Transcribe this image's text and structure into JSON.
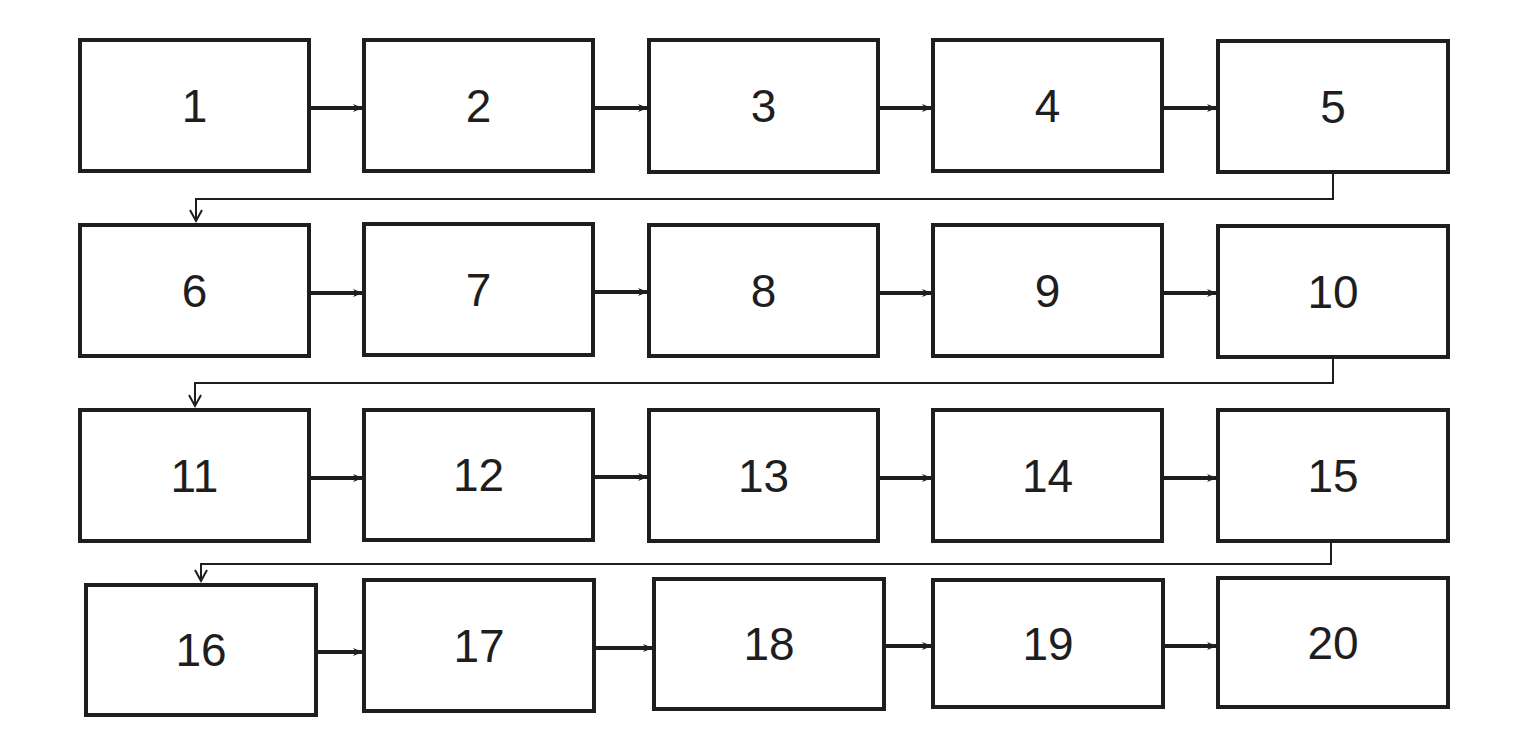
{
  "diagram": {
    "type": "sequential-flowchart",
    "colors": {
      "stroke": "#1e1e1e",
      "background": "#ffffff"
    },
    "steps": [
      {
        "id": 1,
        "label": "1",
        "x": 78,
        "y": 38,
        "w": 233,
        "h": 135
      },
      {
        "id": 2,
        "label": "2",
        "x": 362,
        "y": 38,
        "w": 233,
        "h": 135
      },
      {
        "id": 3,
        "label": "3",
        "x": 647,
        "y": 38,
        "w": 233,
        "h": 136
      },
      {
        "id": 4,
        "label": "4",
        "x": 931,
        "y": 38,
        "w": 233,
        "h": 135
      },
      {
        "id": 5,
        "label": "5",
        "x": 1216,
        "y": 39,
        "w": 234,
        "h": 135
      },
      {
        "id": 6,
        "label": "6",
        "x": 78,
        "y": 223,
        "w": 233,
        "h": 135
      },
      {
        "id": 7,
        "label": "7",
        "x": 362,
        "y": 222,
        "w": 233,
        "h": 135
      },
      {
        "id": 8,
        "label": "8",
        "x": 647,
        "y": 223,
        "w": 233,
        "h": 135
      },
      {
        "id": 9,
        "label": "9",
        "x": 931,
        "y": 223,
        "w": 233,
        "h": 135
      },
      {
        "id": 10,
        "label": "10",
        "x": 1216,
        "y": 224,
        "w": 234,
        "h": 135
      },
      {
        "id": 11,
        "label": "11",
        "x": 78,
        "y": 408,
        "w": 233,
        "h": 135
      },
      {
        "id": 12,
        "label": "12",
        "x": 362,
        "y": 408,
        "w": 233,
        "h": 134
      },
      {
        "id": 13,
        "label": "13",
        "x": 647,
        "y": 408,
        "w": 233,
        "h": 135
      },
      {
        "id": 14,
        "label": "14",
        "x": 931,
        "y": 408,
        "w": 233,
        "h": 135
      },
      {
        "id": 15,
        "label": "15",
        "x": 1216,
        "y": 408,
        "w": 234,
        "h": 135
      },
      {
        "id": 16,
        "label": "16",
        "x": 84,
        "y": 583,
        "w": 234,
        "h": 134
      },
      {
        "id": 17,
        "label": "17",
        "x": 362,
        "y": 578,
        "w": 234,
        "h": 135
      },
      {
        "id": 18,
        "label": "18",
        "x": 652,
        "y": 577,
        "w": 234,
        "h": 134
      },
      {
        "id": 19,
        "label": "19",
        "x": 931,
        "y": 578,
        "w": 234,
        "h": 131
      },
      {
        "id": 20,
        "label": "20",
        "x": 1216,
        "y": 576,
        "w": 234,
        "h": 133
      }
    ],
    "connections": [
      {
        "from": 1,
        "to": 2
      },
      {
        "from": 2,
        "to": 3
      },
      {
        "from": 3,
        "to": 4
      },
      {
        "from": 4,
        "to": 5
      },
      {
        "from": 5,
        "to": 6,
        "kind": "wrap"
      },
      {
        "from": 6,
        "to": 7
      },
      {
        "from": 7,
        "to": 8
      },
      {
        "from": 8,
        "to": 9
      },
      {
        "from": 9,
        "to": 10
      },
      {
        "from": 10,
        "to": 11,
        "kind": "wrap"
      },
      {
        "from": 11,
        "to": 12
      },
      {
        "from": 12,
        "to": 13
      },
      {
        "from": 13,
        "to": 14
      },
      {
        "from": 14,
        "to": 15
      },
      {
        "from": 15,
        "to": 16,
        "kind": "wrap"
      },
      {
        "from": 16,
        "to": 17
      },
      {
        "from": 17,
        "to": 18
      },
      {
        "from": 18,
        "to": 19
      },
      {
        "from": 19,
        "to": 20
      }
    ],
    "wrap_lines": [
      {
        "from": 5,
        "to": 6,
        "drop_x": 1333,
        "line_y": 199,
        "target_x": 196
      },
      {
        "from": 10,
        "to": 11,
        "drop_x": 1333,
        "line_y": 383,
        "target_x": 195
      },
      {
        "from": 15,
        "to": 16,
        "drop_x": 1331,
        "line_y": 564,
        "target_x": 201
      }
    ]
  }
}
